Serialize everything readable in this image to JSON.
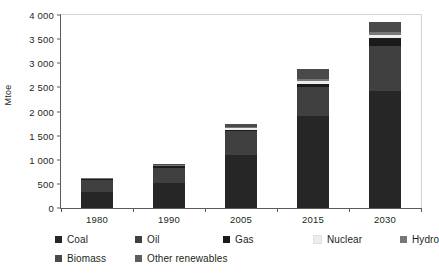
{
  "chart_data": {
    "type": "bar",
    "stacked": true,
    "title": "",
    "xlabel": "",
    "ylabel": "Mtoe",
    "ylim": [
      0,
      4000
    ],
    "ytick_step": 500,
    "ytick_labels": [
      "0",
      "500",
      "1 000",
      "1 500",
      "2 000",
      "2 500",
      "3 000",
      "3 500",
      "4 000"
    ],
    "ytick_values": [
      0,
      500,
      1000,
      1500,
      2000,
      2500,
      3000,
      3500,
      4000
    ],
    "grid": false,
    "legend_position": "bottom",
    "categories": [
      "1980",
      "1990",
      "2005",
      "2015",
      "2030"
    ],
    "series": [
      {
        "name": "Coal",
        "color": "#262626",
        "values": [
          330,
          520,
          1090,
          1880,
          2400
        ]
      },
      {
        "name": "Oil",
        "color": "#404040",
        "values": [
          250,
          310,
          480,
          600,
          930
        ]
      },
      {
        "name": "Gas",
        "color": "#1a1a1a",
        "values": [
          20,
          25,
          35,
          70,
          160
        ]
      },
      {
        "name": "Nuclear",
        "color": "#ededed",
        "values": [
          5,
          10,
          40,
          55,
          60
        ]
      },
      {
        "name": "Hydro",
        "color": "#777777",
        "values": [
          10,
          15,
          25,
          40,
          60
        ]
      },
      {
        "name": "Biomass",
        "color": "#4a4a4a",
        "values": [
          10,
          20,
          60,
          215,
          200
        ]
      },
      {
        "name": "Other renewables",
        "color": "#5e5e5e",
        "values": [
          0,
          0,
          0,
          0,
          0
        ]
      }
    ],
    "totals": [
      625,
      900,
      1730,
      2860,
      3810
    ]
  },
  "legend": {
    "rows": [
      [
        {
          "label": "Coal",
          "color": "#262626"
        },
        {
          "label": "Oil",
          "color": "#404040"
        },
        {
          "label": "Gas",
          "color": "#1a1a1a"
        },
        {
          "label": "Nuclear",
          "color": "#ededed"
        },
        {
          "label": "Hydro",
          "color": "#777777"
        }
      ],
      [
        {
          "label": "Biomass",
          "color": "#4a4a4a"
        },
        {
          "label": "Other renewables",
          "color": "#5e5e5e"
        }
      ]
    ]
  }
}
